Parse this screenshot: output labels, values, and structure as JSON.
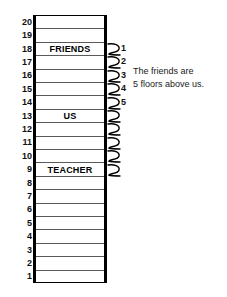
{
  "diagram": {
    "building": {
      "total_floors": 20,
      "floors": [
        {
          "number": "20",
          "label": ""
        },
        {
          "number": "19",
          "label": ""
        },
        {
          "number": "18",
          "label": "FRIENDS"
        },
        {
          "number": "17",
          "label": ""
        },
        {
          "number": "16",
          "label": ""
        },
        {
          "number": "15",
          "label": ""
        },
        {
          "number": "14",
          "label": ""
        },
        {
          "number": "13",
          "label": "US"
        },
        {
          "number": "12",
          "label": ""
        },
        {
          "number": "11",
          "label": ""
        },
        {
          "number": "10",
          "label": ""
        },
        {
          "number": "9",
          "label": "TEACHER"
        },
        {
          "number": "8",
          "label": ""
        },
        {
          "number": "7",
          "label": ""
        },
        {
          "number": "6",
          "label": ""
        },
        {
          "number": "5",
          "label": ""
        },
        {
          "number": "4",
          "label": ""
        },
        {
          "number": "3",
          "label": ""
        },
        {
          "number": "2",
          "label": ""
        },
        {
          "number": "1",
          "label": ""
        }
      ]
    },
    "count_marks": {
      "labels": [
        "1",
        "2",
        "3",
        "4",
        "5"
      ],
      "total_marks": 10
    },
    "annotation": {
      "line1": "The friends are",
      "line2": "5 floors above us."
    },
    "colors": {
      "wall": "#000000",
      "floor_divider": "#5a5a5a",
      "text": "#111111",
      "background": "#ffffff"
    }
  }
}
